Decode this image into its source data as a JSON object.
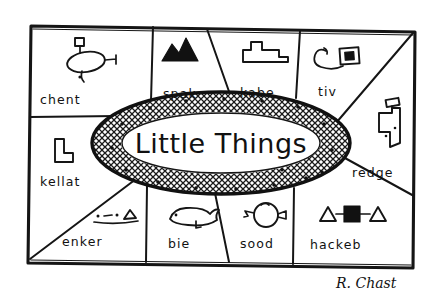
{
  "artwork": {
    "title_center": "Little Things",
    "signature": "R. Chast",
    "medium": "pen-and-ink cartoon",
    "background_color": "#ffffff",
    "ink_color": "#151515"
  },
  "center": {
    "label": "Little Things",
    "word_one": "Little",
    "word_two": "Things",
    "shape_name": "hatched-oval"
  },
  "cells": [
    {
      "id": "chent",
      "label": "chent",
      "icon_name": "blob-with-antenna-icon",
      "position": "top-left"
    },
    {
      "id": "spak",
      "label": "spak",
      "icon_name": "black-mountain-icon",
      "position": "top-center-left"
    },
    {
      "id": "kabe",
      "label": "kabe",
      "icon_name": "stepped-platform-icon",
      "position": "top-center-right"
    },
    {
      "id": "tiv",
      "label": "tiv",
      "icon_name": "hook-with-black-square-icon",
      "position": "top-right"
    },
    {
      "id": "redge",
      "label": "redge",
      "icon_name": "faucet-icon",
      "position": "right"
    },
    {
      "id": "kellat",
      "label": "kellat",
      "icon_name": "l-block-icon",
      "position": "left"
    },
    {
      "id": "enker",
      "label": "enker",
      "icon_name": "dots-and-triangle-on-line-icon",
      "position": "bottom-left"
    },
    {
      "id": "bie",
      "label": "bie",
      "icon_name": "whale-icon",
      "position": "bottom-center-left"
    },
    {
      "id": "sood",
      "label": "sood",
      "icon_name": "circle-with-spout-icon",
      "position": "bottom-center-right"
    },
    {
      "id": "hackeb",
      "label": "hackeb",
      "icon_name": "triangle-square-triangle-icon",
      "position": "bottom-right"
    }
  ]
}
